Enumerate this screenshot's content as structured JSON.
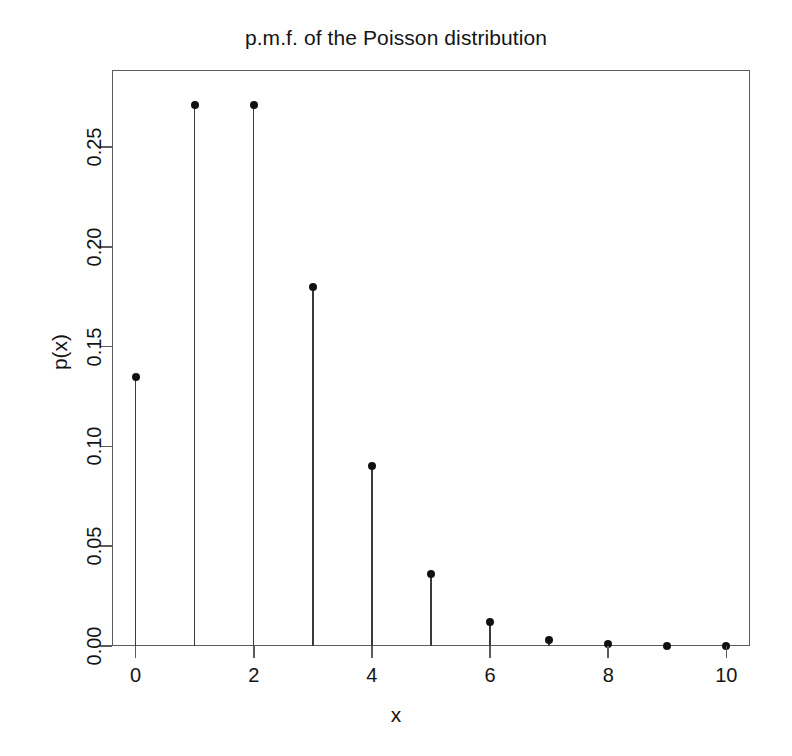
{
  "chart_data": {
    "type": "scatter",
    "title": "p.m.f. of the Poisson distribution",
    "xlabel": "x",
    "ylabel": "p(x)",
    "distribution": "Poisson",
    "lambda": 2,
    "x": [
      0,
      1,
      2,
      3,
      4,
      5,
      6,
      7,
      8,
      9,
      10
    ],
    "values": [
      0.135,
      0.271,
      0.271,
      0.18,
      0.09,
      0.036,
      0.012,
      0.003,
      0.001,
      0.0002,
      0.0
    ],
    "categories": [
      "0",
      "1",
      "2",
      "3",
      "4",
      "5",
      "6",
      "7",
      "8",
      "9",
      "10"
    ],
    "xlim": [
      -0.4,
      10.4
    ],
    "ylim": [
      0.0,
      0.2887
    ],
    "xticks": [
      0,
      2,
      4,
      6,
      8,
      10
    ],
    "xtick_labels": [
      "0",
      "2",
      "4",
      "6",
      "8",
      "10"
    ],
    "yticks": [
      0.0,
      0.05,
      0.1,
      0.15,
      0.2,
      0.25
    ],
    "ytick_labels": [
      "0.00",
      "0.05",
      "0.10",
      "0.15",
      "0.20",
      "0.25"
    ],
    "grid": false,
    "legend": null,
    "marker": "filled-circle",
    "stems": true,
    "colors": {
      "marker": "#111111",
      "stem": "#3a3a3a",
      "axis": "#5c5c5c",
      "background": "#ffffff",
      "text": "#141414"
    }
  }
}
